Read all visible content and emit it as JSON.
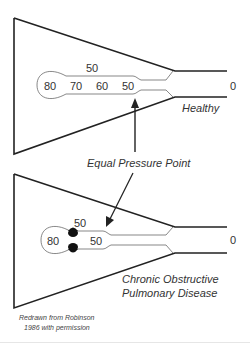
{
  "figure": {
    "healthy": {
      "label": "Healthy",
      "alveolar_pressure": "80",
      "pleural_pressure": "50",
      "airway_pressures": [
        "70",
        "60",
        "50"
      ],
      "mouth_pressure": "0"
    },
    "copd": {
      "label_line1": "Chronic Obstructive",
      "label_line2": "Pulmonary Disease",
      "alveolar_pressure": "80",
      "pleural_pressure": "50",
      "airway_pressure": "50",
      "mouth_pressure": "0"
    },
    "annotation": {
      "equal_pressure_point": "Equal Pressure Point"
    },
    "credit": {
      "line1": "Redrawn from Robinson",
      "line2": "1986 with permission"
    },
    "colors": {
      "stroke": "#222222",
      "text": "#333333",
      "obstruction": "#111111"
    }
  }
}
